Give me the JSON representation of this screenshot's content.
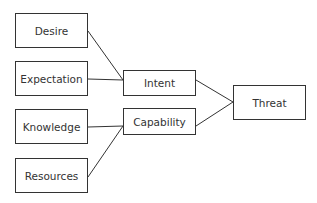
{
  "diagram": {
    "type": "flow",
    "colors": {
      "stroke": "#333333",
      "fill": "#ffffff",
      "text": "#333333"
    },
    "nodes": [
      {
        "id": "desire",
        "label": "Desire",
        "x": 15,
        "y": 13,
        "w": 73,
        "h": 35
      },
      {
        "id": "expectation",
        "label": "Expectation",
        "x": 15,
        "y": 61,
        "w": 73,
        "h": 35
      },
      {
        "id": "knowledge",
        "label": "Knowledge",
        "x": 15,
        "y": 109,
        "w": 73,
        "h": 35
      },
      {
        "id": "resources",
        "label": "Resources",
        "x": 15,
        "y": 158,
        "w": 73,
        "h": 35
      },
      {
        "id": "intent",
        "label": "Intent",
        "x": 123,
        "y": 70,
        "w": 73,
        "h": 26
      },
      {
        "id": "capability",
        "label": "Capability",
        "x": 123,
        "y": 108,
        "w": 73,
        "h": 27
      },
      {
        "id": "threat",
        "label": "Threat",
        "x": 233,
        "y": 85,
        "w": 73,
        "h": 35
      }
    ],
    "edges": [
      {
        "from": "desire",
        "to": "intent"
      },
      {
        "from": "expectation",
        "to": "intent"
      },
      {
        "from": "knowledge",
        "to": "capability"
      },
      {
        "from": "resources",
        "to": "capability"
      },
      {
        "from": "intent",
        "to": "threat"
      },
      {
        "from": "capability",
        "to": "threat"
      }
    ]
  }
}
